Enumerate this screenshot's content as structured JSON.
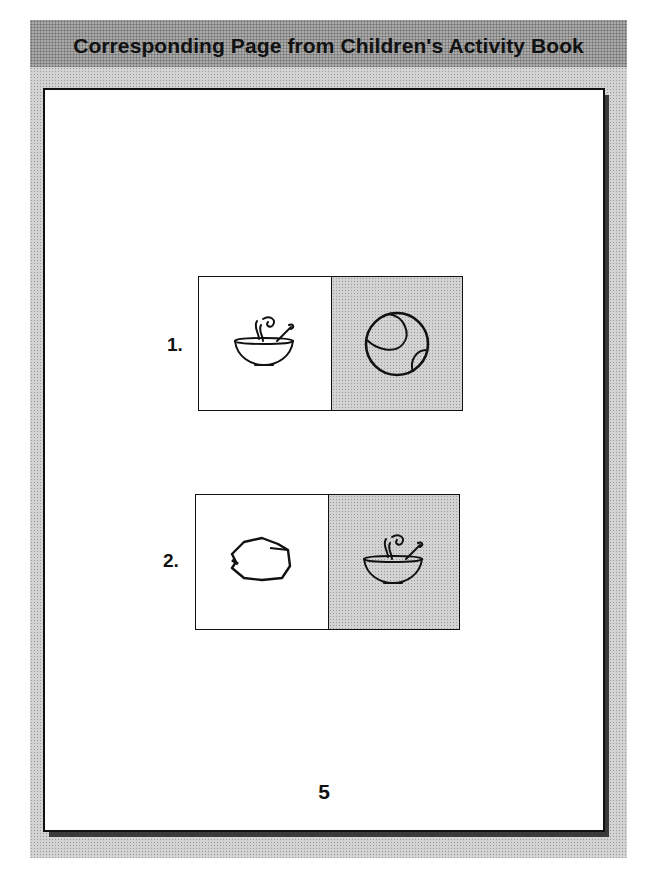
{
  "header": {
    "title": "Corresponding Page from Children's Activity Book"
  },
  "page": {
    "items": [
      {
        "number": "1.",
        "left_picture": "soup-bowl-icon",
        "right_picture": "ball-icon",
        "right_shaded": true
      },
      {
        "number": "2.",
        "left_picture": "rock-icon",
        "right_picture": "soup-bowl-icon",
        "right_shaded": true
      }
    ],
    "page_number": "5"
  },
  "colors": {
    "header_band": "#a9a9a9",
    "frame_band": "#d3d3d3",
    "shaded_cell": "#d3d3d3",
    "ink": "#111111"
  }
}
